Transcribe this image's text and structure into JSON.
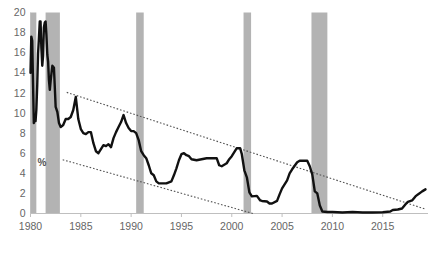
{
  "chart_data": {
    "type": "line",
    "title": "",
    "xlabel": "",
    "ylabel": "%",
    "ylim": [
      0,
      20
    ],
    "xlim": [
      1980,
      2019.5
    ],
    "ytick_values": [
      0,
      2,
      4,
      6,
      8,
      10,
      12,
      14,
      16,
      18,
      20
    ],
    "ytick_labels": [
      "0",
      "2",
      "4",
      "6",
      "8",
      "10",
      "12",
      "14",
      "16",
      "18",
      "20"
    ],
    "xtick_values": [
      1980,
      1985,
      1990,
      1995,
      2000,
      2005,
      2010,
      2015
    ],
    "xtick_labels": [
      "1980",
      "1985",
      "1990",
      "1995",
      "2000",
      "2005",
      "2010",
      "2015"
    ],
    "grid": false,
    "legend": "none",
    "axis_label_inline": "%",
    "line_color": "#111111",
    "line_width": 2.4,
    "shade_color": "#b3b3b3",
    "trend_color": "#555555",
    "axis_color": "#bfbfbf",
    "series": [
      {
        "name": "Federal funds rate",
        "x": [
          1980.0,
          1980.08,
          1980.17,
          1980.25,
          1980.33,
          1980.42,
          1980.5,
          1980.58,
          1980.67,
          1980.75,
          1980.83,
          1980.92,
          1981.0,
          1981.08,
          1981.17,
          1981.25,
          1981.33,
          1981.42,
          1981.5,
          1981.58,
          1981.67,
          1981.75,
          1981.83,
          1981.92,
          1982.0,
          1982.17,
          1982.33,
          1982.5,
          1982.67,
          1982.83,
          1983.0,
          1983.25,
          1983.5,
          1983.75,
          1984.0,
          1984.25,
          1984.5,
          1984.75,
          1985.0,
          1985.25,
          1985.5,
          1985.75,
          1986.0,
          1986.25,
          1986.5,
          1986.75,
          1987.0,
          1987.25,
          1987.5,
          1987.75,
          1988.0,
          1988.25,
          1988.5,
          1988.75,
          1989.0,
          1989.25,
          1989.5,
          1989.75,
          1990.0,
          1990.25,
          1990.5,
          1990.75,
          1991.0,
          1991.25,
          1991.5,
          1991.75,
          1992.0,
          1992.25,
          1992.5,
          1992.75,
          1993.0,
          1993.5,
          1994.0,
          1994.25,
          1994.5,
          1994.75,
          1995.0,
          1995.25,
          1995.5,
          1995.75,
          1996.0,
          1996.5,
          1997.0,
          1997.5,
          1998.0,
          1998.5,
          1998.75,
          1999.0,
          1999.5,
          1999.75,
          2000.0,
          2000.25,
          2000.5,
          2000.83,
          2001.0,
          2001.25,
          2001.5,
          2001.75,
          2002.0,
          2002.5,
          2002.83,
          2003.0,
          2003.5,
          2003.75,
          2004.0,
          2004.5,
          2004.75,
          2005.0,
          2005.5,
          2005.75,
          2006.0,
          2006.5,
          2006.75,
          2007.0,
          2007.5,
          2007.75,
          2008.0,
          2008.25,
          2008.5,
          2008.75,
          2009.0,
          2009.5,
          2010.0,
          2011.0,
          2012.0,
          2013.0,
          2014.0,
          2015.0,
          2015.75,
          2016.0,
          2016.5,
          2016.92,
          2017.25,
          2017.5,
          2017.92,
          2018.25,
          2018.5,
          2018.92,
          2019.25
        ],
        "values": [
          14.0,
          17.6,
          17.2,
          13.0,
          9.0,
          9.5,
          9.2,
          10.3,
          12.8,
          15.9,
          17.3,
          19.1,
          19.1,
          16.5,
          14.7,
          15.7,
          18.5,
          19.0,
          19.1,
          17.8,
          15.8,
          15.1,
          13.3,
          12.3,
          13.2,
          14.7,
          14.5,
          10.6,
          10.1,
          9.0,
          8.6,
          8.8,
          9.4,
          9.4,
          9.6,
          10.3,
          11.6,
          9.4,
          8.4,
          8.0,
          7.9,
          8.1,
          8.1,
          7.0,
          6.2,
          6.0,
          6.4,
          6.8,
          6.7,
          6.9,
          6.6,
          7.5,
          8.1,
          8.6,
          9.1,
          9.8,
          9.0,
          8.5,
          8.2,
          8.2,
          8.0,
          7.3,
          6.2,
          5.8,
          5.5,
          4.8,
          4.0,
          3.8,
          3.2,
          3.0,
          3.0,
          3.0,
          3.2,
          3.8,
          4.5,
          5.3,
          5.9,
          6.0,
          5.8,
          5.7,
          5.4,
          5.3,
          5.4,
          5.5,
          5.5,
          5.5,
          4.8,
          4.7,
          5.0,
          5.4,
          5.7,
          6.1,
          6.5,
          6.5,
          5.9,
          4.3,
          3.6,
          2.1,
          1.7,
          1.75,
          1.3,
          1.25,
          1.2,
          1.0,
          1.0,
          1.25,
          1.9,
          2.5,
          3.3,
          4.0,
          4.4,
          5.1,
          5.25,
          5.25,
          5.25,
          4.7,
          3.9,
          2.2,
          2.0,
          0.8,
          0.2,
          0.15,
          0.15,
          0.1,
          0.15,
          0.1,
          0.1,
          0.12,
          0.2,
          0.35,
          0.4,
          0.5,
          0.9,
          1.15,
          1.3,
          1.7,
          1.9,
          2.2,
          2.4
        ]
      }
    ],
    "recession_bands": [
      {
        "label": "1980 recession",
        "start": 1980.0,
        "end": 1980.58
      },
      {
        "label": "1981-82 recession",
        "start": 1981.5,
        "end": 1982.92
      },
      {
        "label": "1990-91 recession",
        "start": 1990.5,
        "end": 1991.25
      },
      {
        "label": "2001 recession",
        "start": 2001.17,
        "end": 2001.92
      },
      {
        "label": "2008-09 recession",
        "start": 2007.92,
        "end": 2009.5
      }
    ],
    "trend_lines": [
      {
        "name": "upper-channel",
        "x0": 1983.6,
        "y0": 12.05,
        "x1": 2019.2,
        "y1": 0.45,
        "style": "dotted"
      },
      {
        "name": "lower-channel",
        "x0": 1983.2,
        "y0": 5.35,
        "x1": 2002.1,
        "y1": 0.0,
        "style": "dotted"
      }
    ]
  }
}
